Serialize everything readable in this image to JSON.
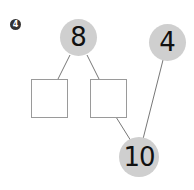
{
  "problem": {
    "number": "4"
  },
  "diagram": {
    "top_left_circle": {
      "value": "8"
    },
    "top_right_circle": {
      "value": "4"
    },
    "bottom_circle": {
      "value": "10"
    },
    "boxes": [
      {
        "value": ""
      },
      {
        "value": ""
      }
    ],
    "colors": {
      "circle_fill": "#cfcfcf",
      "line": "#777777",
      "box_border": "#9a9a9a"
    }
  }
}
